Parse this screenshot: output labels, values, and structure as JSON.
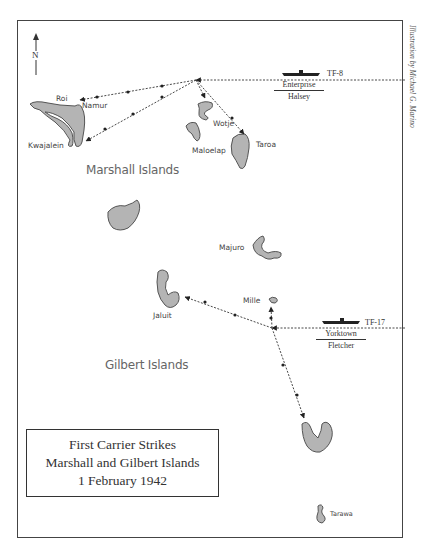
{
  "map": {
    "title_lines": [
      "First Carrier Strikes",
      "Marshall and Gilbert Islands",
      "1 February 1942"
    ],
    "credit": "Illustration by Michael G. Marino",
    "north_label": "N",
    "regions": {
      "marshall": "Marshall Islands",
      "gilbert": "Gilbert Islands"
    },
    "islands": {
      "roi": "Roi",
      "namur": "Namur",
      "kwajalein": "Kwajalein",
      "wotje": "Wotje",
      "maloelap": "Maloelap",
      "taroa": "Taroa",
      "majuro": "Majuro",
      "mille": "Mille",
      "jaluit": "Jaluit",
      "tarawa": "Tarawa"
    },
    "task_forces": [
      {
        "id": "TF-8",
        "carrier": "Enterprise",
        "commander": "Halsey"
      },
      {
        "id": "TF-17",
        "carrier": "Yorktown",
        "commander": "Fletcher"
      }
    ],
    "colors": {
      "land": "#b4b4b4",
      "land_outline": "#555555",
      "route": "#333333",
      "frame": "#444444"
    }
  }
}
